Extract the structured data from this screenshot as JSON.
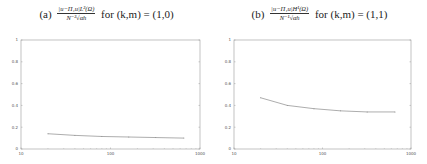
{
  "chart_data": [
    {
      "type": "line",
      "panel_label": "(a)",
      "title": "|u − Π₁u|_{L²(Ω)} / (N⁻² √α_h) for (k,m) = (1,0)",
      "title_parts": {
        "label": "(a)",
        "numerator": "|u−Π₁u|L²(Ω)",
        "denominator": "N⁻²√αh",
        "tail": "for (k,m) = (1,0)"
      },
      "xlabel": "",
      "ylabel": "",
      "xscale": "log",
      "xlim": [
        10,
        1000
      ],
      "ylim": [
        0,
        1
      ],
      "xticks": [
        10,
        100,
        1000
      ],
      "xtick_labels": [
        "10",
        "100",
        "1000"
      ],
      "yticks": [
        0,
        0.2,
        0.4,
        0.6,
        0.8,
        1
      ],
      "ytick_labels": [
        "0",
        "0.2",
        "0.4",
        "0.6",
        "0.8",
        "1"
      ],
      "grid": false,
      "legend": null,
      "x": [
        20,
        40,
        80,
        160,
        320,
        660
      ],
      "series": [
        {
          "name": "ratio",
          "values": [
            0.14,
            0.125,
            0.115,
            0.11,
            0.105,
            0.1
          ]
        }
      ]
    },
    {
      "type": "line",
      "panel_label": "(b)",
      "title": "|u − Π₁u|_{H¹(Ω)} / (N⁻¹ √α_h) for (k,m) = (1,1)",
      "title_parts": {
        "label": "(b)",
        "numerator": "|u−Π₁u|H¹(Ω)",
        "denominator": "N⁻¹√αh",
        "tail": "for (k,m) = (1,1)"
      },
      "xlabel": "",
      "ylabel": "",
      "xscale": "log",
      "xlim": [
        10,
        1000
      ],
      "ylim": [
        0,
        1
      ],
      "xticks": [
        10,
        100,
        1000
      ],
      "xtick_labels": [
        "10",
        "100",
        "1000"
      ],
      "yticks": [
        0,
        0.2,
        0.4,
        0.6,
        0.8,
        1
      ],
      "ytick_labels": [
        "0",
        "0.2",
        "0.4",
        "0.6",
        "0.8",
        "1"
      ],
      "grid": false,
      "legend": null,
      "x": [
        20,
        40,
        80,
        160,
        320,
        660
      ],
      "series": [
        {
          "name": "ratio",
          "values": [
            0.47,
            0.4,
            0.37,
            0.35,
            0.34,
            0.34
          ]
        }
      ]
    }
  ],
  "colors": {
    "axis": "#9a9a9a",
    "line": "#8a8a8a",
    "text": "#222222"
  }
}
